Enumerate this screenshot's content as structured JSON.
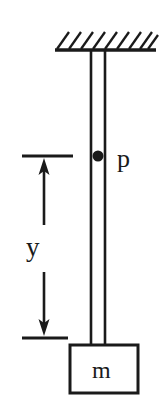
{
  "figure": {
    "background_color": "#ffffff",
    "ink_color": "#1a1a1a"
  },
  "labels": {
    "pivot": "p",
    "mass": "m",
    "distance": "y"
  },
  "ceiling": {
    "name": "fixed support",
    "line_y": 50,
    "line_x_start": 55,
    "line_x_end": 156,
    "hatch_count": 9,
    "hatch_length": 18
  },
  "rod": {
    "left_rail_x": 91,
    "right_rail_x": 105,
    "top_y": 50,
    "bottom_y": 348
  },
  "pivot_point": {
    "cx": 98,
    "cy": 156,
    "r": 5.5
  },
  "mass_block": {
    "x": 70,
    "y": 345,
    "width": 68,
    "height": 48
  },
  "dimension": {
    "upper_extension_line": {
      "x_start": 22,
      "x_end": 73,
      "y": 156
    },
    "lower_extension_line": {
      "x_start": 22,
      "x_end": 68,
      "y": 338
    },
    "arrow_x": 44,
    "up_arrow": {
      "tail_y": 225,
      "head_y": 160
    },
    "down_arrow": {
      "tail_y": 272,
      "head_y": 334
    }
  }
}
